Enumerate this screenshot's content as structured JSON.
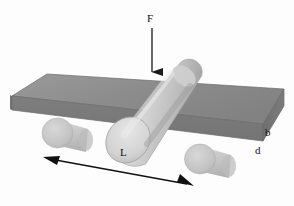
{
  "figure": {
    "background_color": "#fdfdfd"
  },
  "labels": {
    "force": "F",
    "span": "L",
    "width": "b",
    "depth": "d"
  },
  "annotations": {
    "force_arrow": {
      "name": "downward-force-arrow",
      "from": [
        152,
        28
      ],
      "to": [
        152,
        80
      ],
      "color": "#1a1a1a"
    },
    "span_arrow": {
      "name": "span-double-arrow",
      "from": [
        45,
        158
      ],
      "to": [
        192,
        185
      ],
      "color": "#111111",
      "double_headed": true
    }
  },
  "objects": {
    "beam": {
      "name": "rectangular-beam",
      "top_face_color": "#8c8c8c",
      "front_face_color": "#7a7a7a",
      "end_face_color": "#6e6e6e",
      "outline_color": "#5a5a5a"
    },
    "loading_cylinder": {
      "name": "loading-roller",
      "body_color": "#cfcfcf",
      "cap_color": "#dedede",
      "shade_color": "#a8a8a8"
    },
    "support_rollers": [
      {
        "name": "left-support-roller",
        "color": "#c9c9c9"
      },
      {
        "name": "right-support-roller",
        "color": "#c9c9c9"
      }
    ]
  },
  "colors": {
    "ink": "#111111",
    "beam_gray": "#8c8c8c",
    "roller_gray": "#c9c9c9"
  }
}
